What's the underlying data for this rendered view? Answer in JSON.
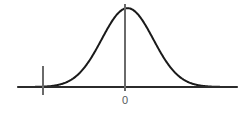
{
  "figure": {
    "background_color": "#ffffff",
    "width": 244,
    "height": 115
  },
  "axis": {
    "baseline_color": "#2b2b2b",
    "baseline_y": 87,
    "x_start": 18,
    "x_end": 237,
    "tick_labels": [
      {
        "name": "zero",
        "text": "0",
        "x": 125,
        "color": "#55585c"
      }
    ]
  },
  "curve": {
    "color": "#1a1a1a",
    "stroke_width": 2,
    "mean_x": 125,
    "peak_y": 4
  },
  "center_line": {
    "name": "mean-vertical-line",
    "color": "#6a6a6a",
    "x": 125,
    "y_top": 4,
    "y_bottom": 91
  },
  "critical_line": {
    "name": "critical-value-vertical-line",
    "color": "#6a6a6a",
    "x": 43,
    "y_top": 66,
    "y_bottom": 95
  },
  "shaded_region": {
    "name": "left-tail-shaded-area",
    "fill_color": "#b8b8b8",
    "x_start": 18,
    "x_end": 43,
    "description": "shaded rejection region in the left tail"
  },
  "chart_data": {
    "type": "line",
    "subtitle": "",
    "xlabel": "",
    "ylabel": "",
    "grid": false,
    "legend": null,
    "xlim": [
      -4.25,
      4.25
    ],
    "ylim": [
      0,
      0.42
    ],
    "tick_labels": [
      "0"
    ],
    "tick_values": [
      0
    ],
    "annotations": [
      {
        "type": "vline",
        "label": "0",
        "x": 0,
        "note": "mean / center line drawn from peak down to axis"
      },
      {
        "type": "vline",
        "label": "",
        "x": -1.95,
        "note": "critical value tick marking right edge of shaded tail"
      },
      {
        "type": "shaded-area",
        "label": "",
        "x_from": -4.25,
        "x_to": -1.95,
        "note": "left tail area under curve filled gray"
      }
    ],
    "series": [
      {
        "name": "normal-pdf",
        "distribution": "normal",
        "mean": 0,
        "sd": 1,
        "x": [
          -4.25,
          -4.0,
          -3.5,
          -3.0,
          -2.5,
          -2.0,
          -1.5,
          -1.0,
          -0.5,
          0.0,
          0.5,
          1.0,
          1.5,
          2.0,
          2.5,
          3.0,
          3.5,
          4.0,
          4.25
        ],
        "values": [
          0.0,
          0.0001,
          0.0009,
          0.0044,
          0.0175,
          0.054,
          0.1295,
          0.242,
          0.3521,
          0.3989,
          0.3521,
          0.242,
          0.1295,
          0.054,
          0.0175,
          0.0044,
          0.0009,
          0.0001,
          0.0
        ]
      }
    ]
  }
}
